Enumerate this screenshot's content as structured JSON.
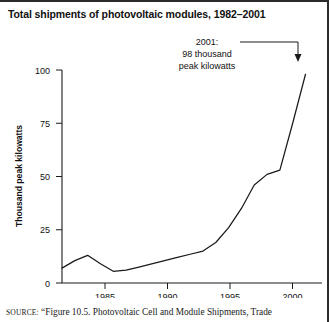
{
  "figure": {
    "title": "Total shipments of photovoltaic modules, 1982–2001",
    "source_label": "SOURCE:",
    "source_text": "“Figure 10.5. Photovoltaic Cell and Module Shipments, Trade"
  },
  "annotation": {
    "line1": "2001:",
    "line2": "98 thousand",
    "line3": "peak kilowatts"
  },
  "axis_labels": {
    "y_title": "Thousand peak kilowatts",
    "y_ticks": [
      "0",
      "25",
      "50",
      "75",
      "100"
    ],
    "x_ticks": [
      "1985",
      "1990",
      "1995",
      "2000"
    ]
  },
  "colors": {
    "line": "#1a1a1a",
    "axis": "#1a1a1a",
    "text": "#111111",
    "background": "#ffffff",
    "frame": "#2b2b2b"
  },
  "chart_data": {
    "type": "line",
    "title": "Total shipments of photovoltaic modules, 1982–2001",
    "xlabel": "",
    "ylabel": "Thousand peak kilowatts",
    "xlim": [
      1982,
      2001
    ],
    "ylim": [
      0,
      100
    ],
    "yticks": [
      0,
      25,
      50,
      75,
      100
    ],
    "xticks": [
      1985,
      1990,
      1995,
      2000
    ],
    "grid": false,
    "legend": "none",
    "x": [
      1982,
      1983,
      1984,
      1985,
      1986,
      1987,
      1988,
      1989,
      1990,
      1991,
      1992,
      1993,
      1994,
      1995,
      1996,
      1997,
      1998,
      1999,
      2000,
      2001
    ],
    "series": [
      {
        "name": "Total shipments",
        "units": "thousand peak kilowatts",
        "values": [
          7,
          10.5,
          13,
          9,
          5.5,
          6,
          7.5,
          9,
          10.5,
          12,
          13.5,
          15,
          19,
          26,
          35,
          46,
          51,
          53,
          75,
          98
        ]
      }
    ],
    "annotations": [
      {
        "text": "2001: 98 thousand peak kilowatts",
        "x": 2001,
        "y": 98
      }
    ]
  }
}
